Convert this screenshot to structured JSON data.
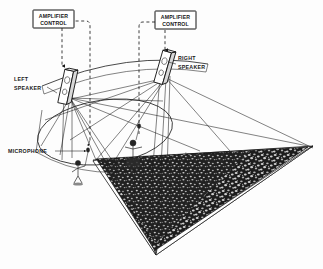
{
  "diagram": {
    "background_color": "#fdfdfd",
    "ink_color": "#1c1c1c",
    "crowd_color": "#1e1e1e",
    "labels": {
      "amplifier_control_left": {
        "line1": "AMPLIFIER",
        "line2": "CONTROL"
      },
      "amplifier_control_right": {
        "line1": "AMPLIFIER",
        "line2": "CONTROL"
      },
      "left_speaker": {
        "line1": "LEFT",
        "line2": "SPEAKER"
      },
      "right_speaker": {
        "line1": "RIGHT",
        "line2": "SPEAKER"
      },
      "microphone": "MICROPHONE"
    },
    "elements": {
      "left_speaker_icon": "loudspeaker-cabinet",
      "right_speaker_icon": "loudspeaker-cabinet",
      "amp_control_left_icon": "control-box",
      "amp_control_right_icon": "control-box",
      "microphone_icon": "microphone-on-stand",
      "performer_icon": "performer-figure",
      "vocalist_icon": "vocalist-figure",
      "audience_icon": "audience-crowd-wedge",
      "stage_icon": "stage-ellipse",
      "coverage_rays_icon": "sound-coverage-rays",
      "control_link_icon": "dashed-control-link"
    }
  }
}
